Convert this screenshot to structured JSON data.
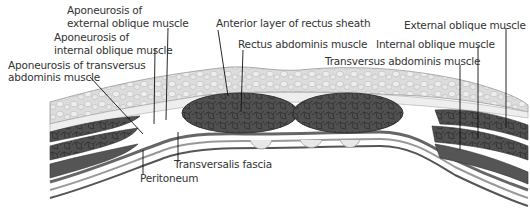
{
  "figure": {
    "labels": {
      "apon_ext_obl": [
        "Aponeurosis of",
        "external oblique muscle"
      ],
      "apon_int_obl": [
        "Aponeurosis of",
        "internal oblique muscle"
      ],
      "apon_transv": [
        "Aponeurosis of transversus",
        "abdominis muscle"
      ],
      "ant_rectus_sheath": "Anterior layer of rectus sheath",
      "rectus": "Rectus abdominis muscle",
      "ext_obl": "External oblique muscle",
      "int_obl": "Internal oblique muscle",
      "transv": "Transversus abdominis muscle",
      "transv_fascia": "Transversalis fascia",
      "peritoneum": "Peritoneum"
    },
    "colors": {
      "muscle": "#4a4a4a",
      "fat": "#d9d9d9",
      "fascia": "#efefef",
      "line": "#111111",
      "text": "#333333"
    }
  }
}
